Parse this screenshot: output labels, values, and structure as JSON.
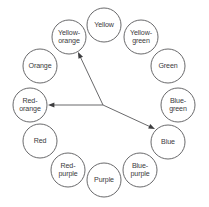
{
  "diagram": {
    "type": "color-wheel-triad",
    "background_color": "#ffffff",
    "stroke_color": "#58585a",
    "text_color": "#3a3a3c",
    "circle_radius": 17,
    "center": {
      "x": 103,
      "y": 105
    },
    "nodes": [
      {
        "id": "yellow",
        "label": "Yellow",
        "lines": [
          "Yellow"
        ],
        "cx": 104,
        "cy": 25,
        "highlighted": false
      },
      {
        "id": "yellow-green",
        "label": "Yellow-green",
        "lines": [
          "Yellow-",
          "green"
        ],
        "cx": 141,
        "cy": 37,
        "highlighted": false
      },
      {
        "id": "green",
        "label": "Green",
        "lines": [
          "Green"
        ],
        "cx": 168,
        "cy": 66,
        "highlighted": false
      },
      {
        "id": "blue-green",
        "label": "Blue-green",
        "lines": [
          "Blue-",
          "green"
        ],
        "cx": 178,
        "cy": 105,
        "highlighted": false
      },
      {
        "id": "blue",
        "label": "Blue",
        "lines": [
          "Blue"
        ],
        "cx": 168,
        "cy": 142,
        "highlighted": true
      },
      {
        "id": "blue-purple",
        "label": "Blue-purple",
        "lines": [
          "Blue-",
          "purple"
        ],
        "cx": 140,
        "cy": 170,
        "highlighted": false
      },
      {
        "id": "purple",
        "label": "Purple",
        "lines": [
          "Purple"
        ],
        "cx": 104,
        "cy": 180,
        "highlighted": false
      },
      {
        "id": "red-purple",
        "label": "Red-purple",
        "lines": [
          "Red-",
          "purple"
        ],
        "cx": 68,
        "cy": 170,
        "highlighted": false
      },
      {
        "id": "red",
        "label": "Red",
        "lines": [
          "Red"
        ],
        "cx": 40,
        "cy": 141,
        "highlighted": false
      },
      {
        "id": "red-orange",
        "label": "Red-orange",
        "lines": [
          "Red-",
          "orange"
        ],
        "cx": 30,
        "cy": 105,
        "highlighted": true
      },
      {
        "id": "orange",
        "label": "Orange",
        "lines": [
          "Orange"
        ],
        "cx": 40,
        "cy": 66,
        "highlighted": false
      },
      {
        "id": "yellow-orange",
        "label": "Yellow-orange",
        "lines": [
          "Yellow-",
          "orange"
        ],
        "cx": 69,
        "cy": 37,
        "highlighted": true
      }
    ],
    "arrows": [
      {
        "id": "arrow-to-yellow-orange",
        "from_id": "center",
        "to_id": "yellow-orange",
        "x1": 103,
        "y1": 105,
        "x2": 78,
        "y2": 52
      },
      {
        "id": "arrow-to-red-orange",
        "from_id": "center",
        "to_id": "red-orange",
        "x1": 103,
        "y1": 105,
        "x2": 48,
        "y2": 105
      },
      {
        "id": "arrow-to-blue",
        "from_id": "center",
        "to_id": "blue",
        "x1": 103,
        "y1": 105,
        "x2": 155,
        "y2": 129
      }
    ]
  }
}
